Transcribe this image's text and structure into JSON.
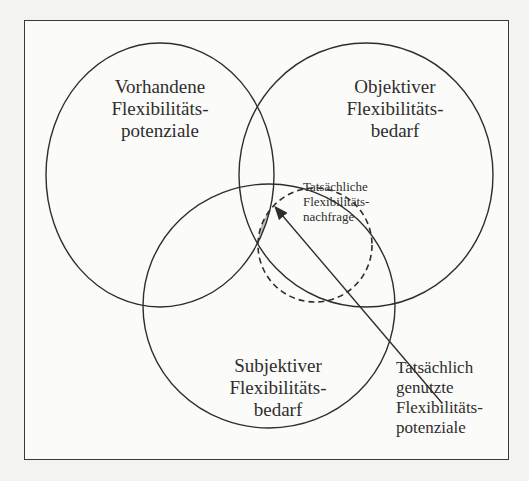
{
  "diagram": {
    "type": "venn",
    "sets": [
      {
        "id": "vorhandene",
        "lines": [
          "Vorhandene",
          "Flexibilitäts-",
          "potenziale"
        ]
      },
      {
        "id": "objektiver",
        "lines": [
          "Objektiver",
          "Flexibilitäts-",
          "bedarf"
        ]
      },
      {
        "id": "subjektiver",
        "lines": [
          "Subjektiver",
          "Flexibilitäts-",
          "bedarf"
        ]
      }
    ],
    "dashed_set": {
      "id": "nachfrage",
      "lines": [
        "Tatsächliche",
        "Flexibilitäts-",
        "nachfrage"
      ]
    },
    "callout": {
      "id": "genutzte",
      "lines": [
        "Tatsächlich",
        "genutzte",
        "Flexibilitäts-",
        "potenziale"
      ]
    },
    "highlight_fill": "#bdbdbd",
    "line_color": "#2e2e2e"
  }
}
